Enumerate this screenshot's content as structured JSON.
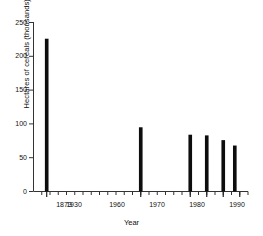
{
  "chart_data": {
    "type": "bar",
    "title": "",
    "subtitle": "",
    "xlabel": "Year",
    "ylabel": "Hectares of cereals (thousands)",
    "categories": [
      "1873",
      "1930",
      "1960",
      "1970",
      "1980",
      "1987"
    ],
    "x": [
      1873,
      1930,
      1960,
      1970,
      1980,
      1987
    ],
    "values": [
      226,
      95,
      84,
      83,
      76,
      68
    ],
    "xlim": [
      1865,
      1995
    ],
    "ylim": [
      0,
      250
    ],
    "yticks": [
      0,
      50,
      100,
      150,
      200,
      250
    ],
    "ytick_labels": [
      "0",
      "50",
      "100",
      "150",
      "200",
      "250"
    ],
    "xticks": [
      1873,
      1930,
      1960,
      1970,
      1980,
      1990
    ],
    "xtick_labels": [
      "1873",
      "1930",
      "1960",
      "1970",
      "1980",
      "1990"
    ],
    "x_minor_tick_interval": 5,
    "grid": false,
    "legend": null,
    "legend_position": "none",
    "bar_color": "#0d0d0d",
    "axis_color": "#333333",
    "bar_width_years": 2.2,
    "annotations": []
  },
  "axes": {
    "y_axis_name": "hectares-axis",
    "x_axis_name": "year-axis"
  }
}
